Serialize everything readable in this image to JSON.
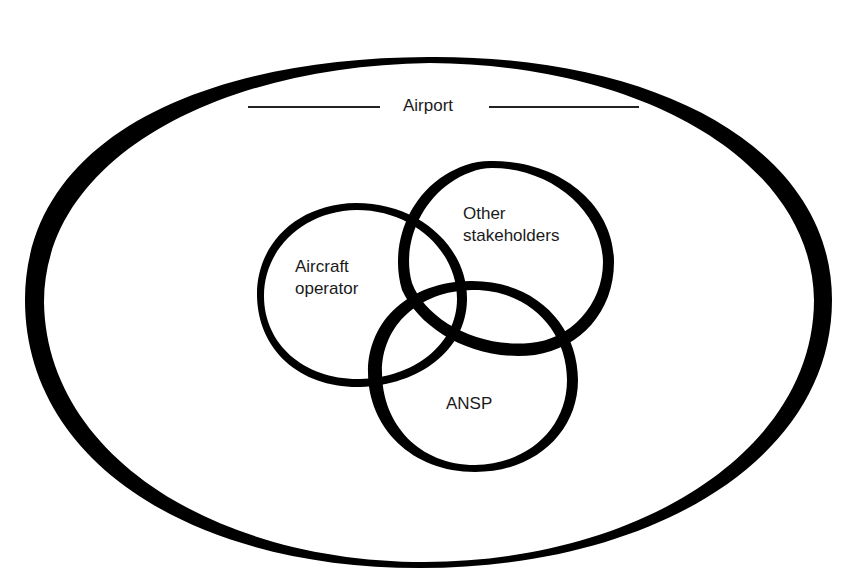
{
  "diagram": {
    "type": "venn",
    "container": {
      "label": "Airport",
      "shape": "ellipse"
    },
    "sets": [
      {
        "id": "aircraft-operator",
        "label": "Aircraft\noperator"
      },
      {
        "id": "other-stakeholders",
        "label": "Other\nstakeholders"
      },
      {
        "id": "ansp",
        "label": "ANSP"
      }
    ],
    "colors": {
      "stroke": "#000000",
      "text": "#1a1a1a",
      "background": "#ffffff"
    }
  }
}
